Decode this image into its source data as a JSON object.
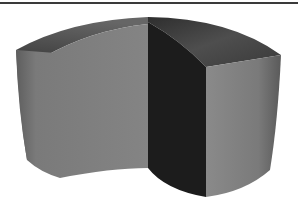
{
  "figure": {
    "colors": {
      "background": "#ffffff",
      "rule_line": "#3a3a3a",
      "left_face": "#7d7d7d",
      "top_surface_left": "#5a5a5a",
      "top_surface_right": "#4d4d4d",
      "cut_face": "#1e1e1e",
      "right_face": "#7a7a7a"
    }
  }
}
